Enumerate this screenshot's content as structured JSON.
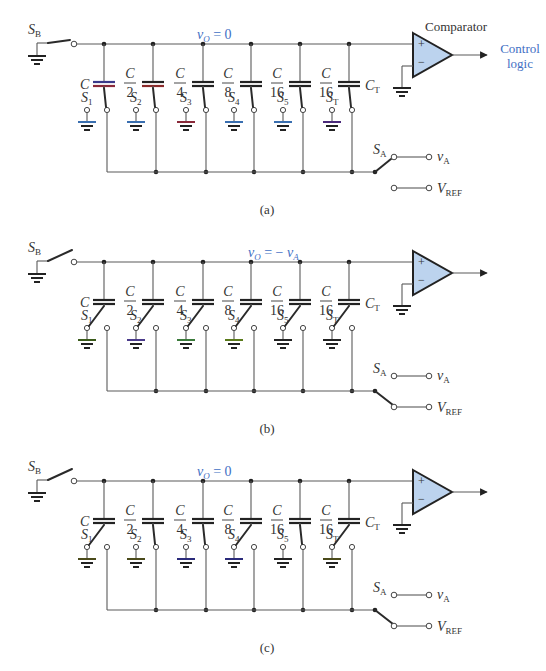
{
  "figure": {
    "panels": [
      {
        "id": "a",
        "caption": "(a)",
        "node_label": "vO = 0",
        "node_label_parts": {
          "var": "v",
          "sub": "O",
          "rest": " = 0"
        },
        "comparator_label": "Comparator",
        "output_label_line1": "Control",
        "output_label_line2": "logic",
        "capacitors": [
          "C",
          "C/2",
          "C/4",
          "C/8",
          "C/16",
          "C/16"
        ],
        "terminal_capacitor_label": "CT",
        "switches": [
          "S1",
          "S2",
          "S3",
          "S4",
          "S5",
          "ST"
        ],
        "switch_states": [
          "bus",
          "bus",
          "bus",
          "bus",
          "bus",
          "bus"
        ],
        "SB_state": "closed",
        "SA_state": "vA",
        "sources": [
          "vA",
          "VREF"
        ]
      },
      {
        "id": "b",
        "caption": "(b)",
        "node_label": "vO = − vA",
        "node_label_parts": {
          "var": "v",
          "sub": "O",
          "rest": " = − ",
          "var2": "v",
          "sub2": "A"
        },
        "capacitors": [
          "C",
          "C/2",
          "C/4",
          "C/8",
          "C/16",
          "C/16"
        ],
        "terminal_capacitor_label": "CT",
        "switches": [
          "S1",
          "S2",
          "S3",
          "S4",
          "S5",
          "ST"
        ],
        "switch_states": [
          "ground",
          "ground",
          "ground",
          "ground",
          "ground",
          "ground"
        ],
        "SB_state": "open",
        "SA_state": "VREF",
        "sources": [
          "vA",
          "VREF"
        ]
      },
      {
        "id": "c",
        "caption": "(c)",
        "node_label": "vO = 0",
        "node_label_parts": {
          "var": "v",
          "sub": "O",
          "rest": " = 0"
        },
        "capacitors": [
          "C",
          "C/2",
          "C/4",
          "C/8",
          "C/16",
          "C/16"
        ],
        "terminal_capacitor_label": "CT",
        "switches": [
          "S1",
          "S2",
          "S3",
          "S4",
          "S5",
          "ST"
        ],
        "switch_states": [
          "ground",
          "bus",
          "bus",
          "ground",
          "bus",
          "ground"
        ],
        "SB_state": "open",
        "SA_state": "VREF",
        "sources": [
          "vA",
          "VREF"
        ]
      }
    ],
    "labels": {
      "SB": "S",
      "SB_sub": "B",
      "SA": "S",
      "SA_sub": "A",
      "vA": "v",
      "vA_sub": "A",
      "VREF": "V",
      "VREF_sub": "REF",
      "CT": "C",
      "CT_sub": "T",
      "C": "C",
      "den2": "2",
      "den4": "4",
      "den8": "8",
      "den16": "16",
      "S": "S",
      "s1": "1",
      "s2": "2",
      "s3": "3",
      "s4": "4",
      "s5": "5",
      "sT": "T",
      "plus": "+",
      "minus": "−"
    },
    "colors": {
      "wire": "#5a5a5a",
      "accent_blue": "#3f6fc4",
      "opamp_fill": "#bcd3ee"
    }
  }
}
